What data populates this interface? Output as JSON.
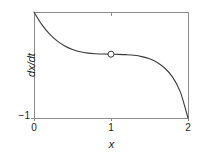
{
  "chart_data": {
    "type": "line",
    "title": "",
    "subtitle": "",
    "xlabel": "x",
    "ylabel": "dx/dt",
    "xlim": [
      0,
      2
    ],
    "ylim": [
      -1,
      0.62
    ],
    "grid": false,
    "legend": null,
    "x_ticks": [
      {
        "value": 0,
        "label": "0"
      },
      {
        "value": 1,
        "label": "1"
      },
      {
        "value": 2,
        "label": "2"
      }
    ],
    "y_ticks": [
      {
        "value": -1,
        "label": "−1"
      }
    ],
    "top_axis_ticks": [
      {
        "value": 1,
        "label": ""
      }
    ],
    "series": [
      {
        "name": "dx/dt curve",
        "color": "#3a3a3a",
        "linewidth": 1.1,
        "x": [
          0.0,
          0.1,
          0.2,
          0.3,
          0.4,
          0.5,
          0.6,
          0.7,
          0.8,
          0.9,
          1.0,
          1.1,
          1.2,
          1.3,
          1.4,
          1.5,
          1.6,
          1.7,
          1.8,
          1.9,
          2.0
        ],
        "y": [
          0.62,
          0.43,
          0.285,
          0.178,
          0.1,
          0.046,
          0.012,
          -0.008,
          -0.018,
          -0.023,
          -0.025,
          -0.027,
          -0.032,
          -0.042,
          -0.062,
          -0.096,
          -0.152,
          -0.24,
          -0.375,
          -0.6,
          -1.0
        ]
      }
    ],
    "markers": [
      {
        "name": "fixed-point",
        "x": 1.0,
        "y": -0.025,
        "style": "open-circle",
        "radius": 3.0,
        "facecolor": "#ffffff",
        "edgecolor": "#3a3a3a",
        "label": ""
      }
    ],
    "axes_box": {
      "left": 34,
      "top": 12,
      "right": 189,
      "bottom": 118,
      "color": "#8c8c8c",
      "linewidth": 1
    }
  },
  "figure": {
    "background": "#ffffff",
    "axis_color": "#8c8c8c",
    "curve_color": "#3a3a3a",
    "text_color": "#1a1a1a"
  }
}
